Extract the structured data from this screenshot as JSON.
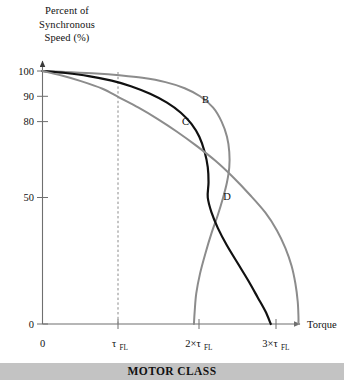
{
  "figure": {
    "banner_label": "MOTOR CLASS",
    "banner_color": "#c3c3c3"
  },
  "chart_data": {
    "type": "line",
    "title": "",
    "ylabel_lines": [
      "Percent of",
      "Synchronous",
      "Speed (%)"
    ],
    "ylabel": "Percent of Synchronous Speed (%)",
    "xlabel": "Torque",
    "xlim": [
      0,
      3.35
    ],
    "ylim": [
      0,
      100
    ],
    "grid": false,
    "legend": "inline-curve-labels",
    "x_ticks": [
      {
        "value": 0,
        "label": "0",
        "sub": ""
      },
      {
        "value": 1,
        "label": "τ",
        "sub": "FL"
      },
      {
        "value": 2,
        "label": "2×τ",
        "sub": "FL"
      },
      {
        "value": 3,
        "label": "3×τ",
        "sub": "FL"
      }
    ],
    "y_ticks": [
      {
        "value": 0,
        "label": "0"
      },
      {
        "value": 50,
        "label": "50"
      },
      {
        "value": 80,
        "label": "80"
      },
      {
        "value": 90,
        "label": "90"
      },
      {
        "value": 100,
        "label": "100"
      }
    ],
    "annotations": [
      {
        "text": "τ",
        "sub": "FL",
        "type": "vertical-dashed-line",
        "x": 1.0
      }
    ],
    "series": [
      {
        "name": "B",
        "label": "B",
        "color": "#8c8c8c",
        "width": 2.0,
        "label_position": {
          "x": 2.12,
          "y": 87.5
        },
        "points": [
          [
            0.0,
            100.0
          ],
          [
            0.3,
            99.6
          ],
          [
            0.7,
            99.0
          ],
          [
            1.0,
            98.3
          ],
          [
            1.3,
            97.3
          ],
          [
            1.6,
            95.6
          ],
          [
            1.85,
            93.2
          ],
          [
            2.05,
            90.0
          ],
          [
            2.22,
            85.5
          ],
          [
            2.33,
            80.0
          ],
          [
            2.4,
            74.0
          ],
          [
            2.43,
            68.0
          ],
          [
            2.43,
            62.0
          ],
          [
            2.4,
            56.0
          ],
          [
            2.35,
            50.0
          ],
          [
            2.28,
            43.0
          ],
          [
            2.2,
            36.0
          ],
          [
            2.12,
            28.0
          ],
          [
            2.05,
            20.0
          ],
          [
            2.0,
            12.0
          ],
          [
            1.98,
            5.0
          ],
          [
            1.97,
            0.0
          ]
        ]
      },
      {
        "name": "C",
        "label": "C",
        "color": "#111111",
        "width": 2.2,
        "label_position": {
          "x": 1.86,
          "y": 78.5
        },
        "points": [
          [
            0.0,
            100.0
          ],
          [
            0.3,
            99.2
          ],
          [
            0.6,
            98.0
          ],
          [
            0.9,
            96.2
          ],
          [
            1.15,
            94.0
          ],
          [
            1.4,
            91.0
          ],
          [
            1.62,
            87.5
          ],
          [
            1.8,
            83.5
          ],
          [
            1.94,
            79.0
          ],
          [
            2.04,
            74.0
          ],
          [
            2.11,
            68.0
          ],
          [
            2.15,
            62.0
          ],
          [
            2.16,
            56.0
          ],
          [
            2.15,
            50.0
          ],
          [
            2.2,
            44.0
          ],
          [
            2.28,
            38.0
          ],
          [
            2.4,
            31.0
          ],
          [
            2.54,
            24.0
          ],
          [
            2.68,
            17.0
          ],
          [
            2.8,
            10.5
          ],
          [
            2.9,
            5.0
          ],
          [
            2.97,
            0.0
          ]
        ]
      },
      {
        "name": "D",
        "label": "D",
        "color": "#8c8c8c",
        "width": 2.0,
        "label_position": {
          "x": 2.4,
          "y": 49.0
        },
        "points": [
          [
            0.0,
            100.0
          ],
          [
            0.25,
            98.2
          ],
          [
            0.5,
            96.0
          ],
          [
            0.78,
            93.0
          ],
          [
            1.0,
            89.5
          ],
          [
            1.25,
            85.5
          ],
          [
            1.5,
            81.0
          ],
          [
            1.75,
            76.0
          ],
          [
            2.0,
            70.5
          ],
          [
            2.25,
            64.5
          ],
          [
            2.48,
            58.0
          ],
          [
            2.7,
            51.0
          ],
          [
            2.9,
            44.0
          ],
          [
            3.05,
            37.0
          ],
          [
            3.16,
            30.0
          ],
          [
            3.24,
            23.0
          ],
          [
            3.29,
            16.0
          ],
          [
            3.32,
            9.0
          ],
          [
            3.33,
            3.0
          ],
          [
            3.33,
            0.0
          ]
        ]
      }
    ]
  }
}
